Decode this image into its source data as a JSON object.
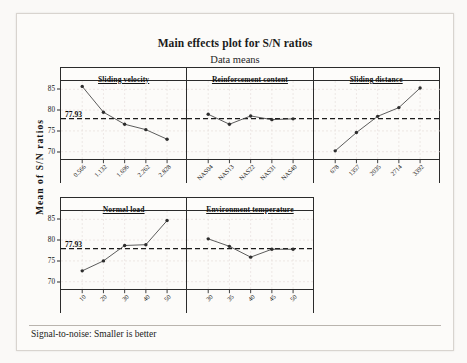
{
  "title": "Main effects plot for S/N ratios",
  "subtitle": "Data means",
  "ylabel": "Mean of S/N ratios",
  "footer": "Signal-to-noise: Smaller is better",
  "reference_label": "77.93",
  "chart_data": {
    "type": "line",
    "title": "Main effects plot for S/N ratios",
    "subtitle": "Data means",
    "ylabel": "Mean of S/N ratios",
    "xlabel": "",
    "ylim": [
      68,
      87
    ],
    "yticks": [
      70,
      75,
      80,
      85
    ],
    "grid": true,
    "legend": "none",
    "reference_line": 77.93,
    "annotation": "Signal-to-noise: Smaller is better",
    "panels": [
      {
        "name": "Sliding velocity",
        "categories": [
          "0.566",
          "1.132",
          "1.696",
          "2.262",
          "2.828"
        ],
        "values": [
          85.7,
          79.5,
          76.6,
          75.3,
          73.0
        ]
      },
      {
        "name": "Reinforcement content",
        "categories": [
          "NAS04",
          "NAS13",
          "NAS22",
          "NAS31",
          "NAS40"
        ],
        "values": [
          79.0,
          76.6,
          78.6,
          77.7,
          77.9
        ]
      },
      {
        "name": "Sliding distance",
        "categories": [
          "678",
          "1357",
          "2035",
          "2714",
          "3392"
        ],
        "values": [
          70.2,
          74.6,
          78.5,
          80.6,
          85.3
        ]
      },
      {
        "name": "Normal load",
        "categories": [
          "10",
          "20",
          "30",
          "40",
          "50"
        ],
        "values": [
          72.6,
          75.0,
          78.7,
          78.9,
          84.7
        ]
      },
      {
        "name": "Environment temperature",
        "categories": [
          "30",
          "35",
          "40",
          "45",
          "50"
        ],
        "values": [
          80.3,
          78.5,
          75.9,
          77.8,
          77.8
        ]
      }
    ]
  }
}
